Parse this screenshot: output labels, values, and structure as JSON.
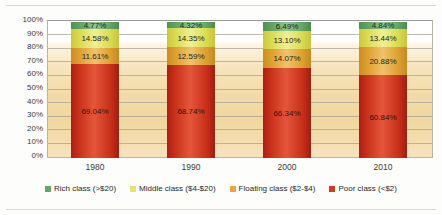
{
  "chart_data": {
    "type": "bar",
    "subtype": "100% stacked column",
    "title": "",
    "xlabel": "",
    "ylabel": "",
    "ylim": [
      0,
      100
    ],
    "yunit": "%",
    "grid": true,
    "legend_position": "bottom",
    "categories": [
      "1980",
      "1990",
      "2000",
      "2010"
    ],
    "ytick_labels": [
      "0%",
      "10%",
      "20%",
      "30%",
      "40%",
      "50%",
      "60%",
      "70%",
      "80%",
      "90%",
      "100%"
    ],
    "ytick_values": [
      0,
      10,
      20,
      30,
      40,
      50,
      60,
      70,
      80,
      90,
      100
    ],
    "series": [
      {
        "name": "Rich class (>$20)",
        "color": "#63a866",
        "values": [
          4.77,
          4.32,
          6.49,
          4.84
        ],
        "labels": [
          "4.77%",
          "4.32%",
          "6.49%",
          "4.84%"
        ]
      },
      {
        "name": "Middle class ($4-$20)",
        "color": "#dcdc55",
        "values": [
          14.58,
          14.35,
          13.1,
          13.44
        ],
        "labels": [
          "14.58%",
          "14.35%",
          "13.10%",
          "13.44%"
        ]
      },
      {
        "name": "Floating class ($2-$4)",
        "color": "#dfa231",
        "values": [
          11.61,
          12.59,
          14.07,
          20.88
        ],
        "labels": [
          "11.61%",
          "12.59%",
          "14.07%",
          "20.88%"
        ]
      },
      {
        "name": "Poor class (<$2)",
        "color": "#c8301a",
        "values": [
          69.04,
          68.74,
          66.34,
          60.84
        ],
        "labels": [
          "69.04%",
          "68.74%",
          "66.34%",
          "60.84%"
        ]
      }
    ]
  },
  "legend": {
    "items": [
      {
        "label": "Rich class (>$20)",
        "color": "#63a866"
      },
      {
        "label": "Middle class ($4-$20)",
        "color": "#e3e36a"
      },
      {
        "label": "Floating class ($2-$4)",
        "color": "#eda63d"
      },
      {
        "label": "Poor class (<$2)",
        "color": "#d33a22"
      }
    ]
  }
}
